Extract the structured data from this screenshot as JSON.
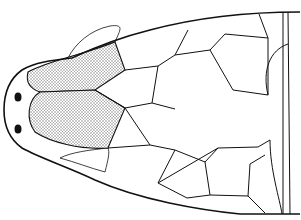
{
  "figure": {
    "colors": {
      "stroke": "#111111",
      "fill": "#ffffff",
      "stipple": "#bdbdbd",
      "eye": "#111111"
    },
    "outline": "M300,12 C250,12 195,18 150,30 C110,40 85,52 72,58 C55,60 35,62 22,70 C8,80 4,95 4,110 C4,125 8,138 22,148 C40,158 70,168 95,180 C140,200 200,210 240,214 L300,214",
    "shaded_scales": [
      "M28,72 C50,60 80,56 115,42 L125,70 L95,90 L40,92 C28,88 26,80 28,72 Z",
      "M40,92 L95,90 L125,108 L108,148 C80,150 50,142 35,132 C26,120 27,100 40,92 Z"
    ],
    "scale_lines": [
      "M125,70 L158,66 L175,55",
      "M158,66 L152,103",
      "M95,90 L125,108",
      "M125,108 L152,103",
      "M152,103 L175,109",
      "M125,108 L150,145",
      "M150,145 L175,150",
      "M108,148 L150,145",
      "M175,55 L188,30",
      "M175,55 L210,50",
      "M210,50 L225,34",
      "M225,34 L268,38",
      "M268,38 L259,14",
      "M210,50 L233,90",
      "M233,90 L268,95",
      "M268,95 L268,38",
      "M268,95 C262,70 270,50 288,44",
      "M175,150 L205,162",
      "M205,162 L218,148",
      "M218,148 L258,147",
      "M258,147 L270,140",
      "M205,162 L210,195",
      "M210,195 L248,196",
      "M248,196 L250,164",
      "M250,164 L265,155",
      "M175,150 L158,183",
      "M158,183 L218,148",
      "M158,183 L187,198",
      "M187,198 L210,195",
      "M248,196 L265,213",
      "M283,12 L283,214",
      "M288,12 L290,214",
      "M270,140 C270,170 280,200 282,214"
    ],
    "small_scale_patches": [
      "M68,58 C75,44 90,30 110,26 C125,24 120,30 115,42 C100,46 85,52 68,58 Z",
      "M60,158 C75,162 90,168 105,172 C108,160 110,152 108,148 C90,150 72,152 60,158 Z"
    ],
    "eyes": [
      {
        "cx": 18,
        "cy": 97,
        "rx": 3.5,
        "ry": 4.5
      },
      {
        "cx": 18,
        "cy": 129,
        "rx": 3.5,
        "ry": 4.5
      }
    ]
  }
}
